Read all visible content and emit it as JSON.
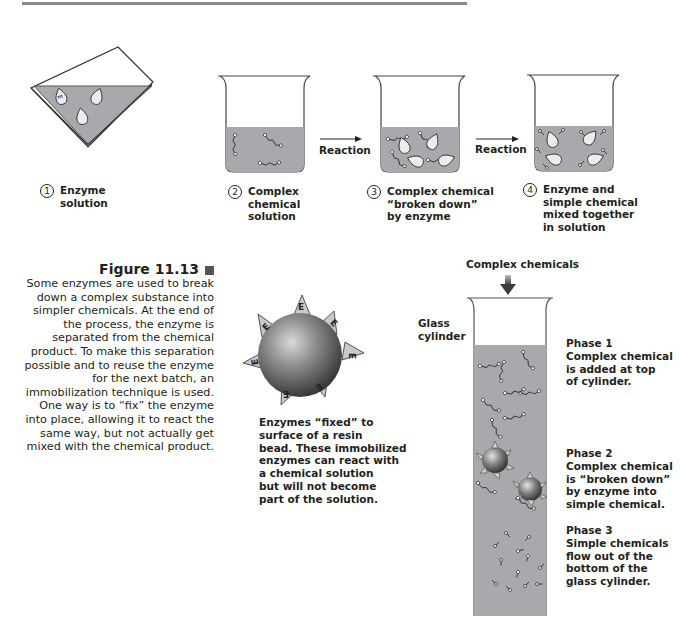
{
  "header": {
    "rule_color": "#7a7a7a"
  },
  "top_row": {
    "steps": [
      {
        "number": "1",
        "label_lines": [
          "Enzyme",
          "solution"
        ]
      },
      {
        "number": "2",
        "label_lines": [
          "Complex",
          "chemical",
          "solution"
        ]
      },
      {
        "number": "3",
        "label_lines": [
          "Complex chemical",
          "“broken down”",
          "by enzyme"
        ]
      },
      {
        "number": "4",
        "label_lines": [
          "Enzyme and",
          "simple chemical",
          "mixed together",
          "in solution"
        ]
      }
    ],
    "arrows": [
      {
        "label": "Reaction"
      },
      {
        "label": "Reaction"
      }
    ],
    "enzyme_glyph": "E",
    "liquid_color": "#a7a9ac"
  },
  "caption": {
    "title": "Figure 11.13",
    "body_lines": [
      "Some enzymes are used to break",
      "down a complex substance into",
      "simpler chemicals. At the end of",
      "the process, the enzyme is",
      "separated from the chemical",
      "product. To make this separation",
      "possible and to reuse the enzyme",
      "for the next batch, an",
      "immobilization technique is used.",
      "One way is to “fix” the enzyme",
      "into place, allowing it to react the",
      "same way, but not actually get",
      "mixed with the chemical product."
    ]
  },
  "bead": {
    "enzyme_glyph": "E",
    "description_lines": [
      "Enzymes “fixed” to",
      "surface of a resin",
      "bead. These immobilized",
      "enzymes can react with",
      "a chemical solution",
      "but will not become",
      "part of the solution."
    ]
  },
  "cylinder": {
    "input_label": "Complex chemicals",
    "side_label_lines": [
      "Glass",
      "cylinder"
    ],
    "phases": [
      {
        "title": "Phase 1",
        "lines": [
          "Complex chemical",
          "is added at top",
          "of cylinder."
        ]
      },
      {
        "title": "Phase 2",
        "lines": [
          "Complex chemical",
          "is “broken down”",
          "by enzyme into",
          "simple chemical."
        ]
      },
      {
        "title": "Phase 3",
        "lines": [
          "Simple chemicals",
          "flow out of the",
          "bottom of the",
          "glass cylinder."
        ]
      }
    ]
  }
}
